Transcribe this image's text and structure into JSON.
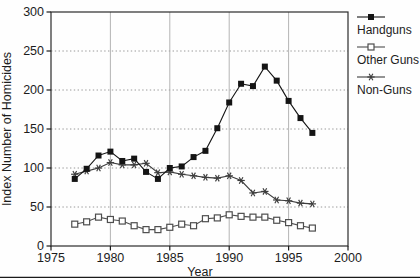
{
  "figure": {
    "kind": "scanned statistical figure",
    "background": "#fefefe"
  },
  "colors": {
    "ink": "#141414",
    "frame": "#2a2a2a",
    "grid_horizontal": "#8f8f8f",
    "grid_vertical": "#ababab",
    "tick": "#1c1c1c",
    "background": "#fefefe"
  },
  "legend": {
    "position": "outside-right-top",
    "entries": [
      {
        "label": "Handguns",
        "marker": "filled-square"
      },
      {
        "label": "Other Guns",
        "marker": "open-square"
      },
      {
        "label": "Non-Guns",
        "marker": "asterisk"
      }
    ]
  },
  "chart_data": {
    "type": "line",
    "title": "",
    "xlabel": "Year",
    "ylabel": "Index Number of Homicides",
    "xlim": [
      1975,
      2000
    ],
    "ylim": [
      0,
      300
    ],
    "x_ticks": [
      1975,
      1980,
      1985,
      1990,
      1995,
      2000
    ],
    "y_ticks": [
      0,
      50,
      100,
      150,
      200,
      250,
      300
    ],
    "grid": {
      "horizontal": "dotted",
      "vertical": "solid"
    },
    "legend_position": "outside-right-top",
    "x": [
      1977,
      1978,
      1979,
      1980,
      1981,
      1982,
      1983,
      1984,
      1985,
      1986,
      1987,
      1988,
      1989,
      1990,
      1991,
      1992,
      1993,
      1994,
      1995,
      1996,
      1997
    ],
    "series": [
      {
        "name": "Handguns",
        "marker": "filled-square",
        "color": "#141414",
        "values": [
          86,
          99,
          116,
          121,
          109,
          112,
          95,
          86,
          100,
          102,
          114,
          122,
          151,
          184,
          208,
          205,
          230,
          212,
          186,
          164,
          145
        ]
      },
      {
        "name": "Other Guns",
        "marker": "open-square",
        "color": "#4e4e4e",
        "values": [
          28,
          31,
          37,
          34,
          32,
          26,
          21,
          21,
          24,
          28,
          26,
          35,
          36,
          40,
          38,
          37,
          37,
          33,
          30,
          26,
          23
        ]
      },
      {
        "name": "Non-Guns",
        "marker": "asterisk",
        "color": "#3c3c3c",
        "values": [
          92,
          96,
          100,
          107,
          104,
          104,
          106,
          94,
          95,
          92,
          90,
          88,
          87,
          90,
          84,
          68,
          70,
          59,
          58,
          55,
          54
        ]
      }
    ]
  }
}
